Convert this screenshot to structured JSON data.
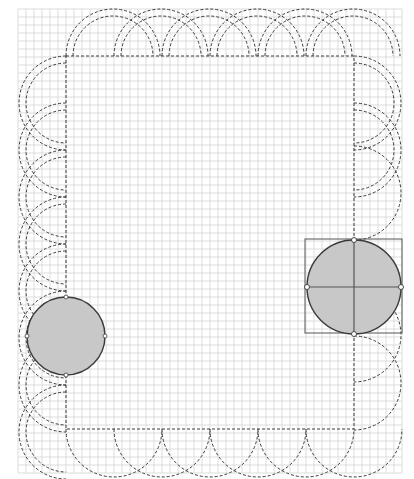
{
  "canvas": {
    "background": "#ffffff",
    "grid_color": "#d4d4d4",
    "stroke_color": "#3a3a3a",
    "fill_color": "#c8c8c8",
    "selection_color": "#555555",
    "handle_color": "#ffffff"
  },
  "design": {
    "kind": "quilt-border-layout",
    "border_arcs": {
      "top": "double",
      "left": "double",
      "bottom": "single",
      "right": "mixed"
    },
    "shapes": [
      {
        "id": "circle-left",
        "type": "circle",
        "selected": false
      },
      {
        "id": "circle-right",
        "type": "circle",
        "selected": true
      }
    ]
  }
}
